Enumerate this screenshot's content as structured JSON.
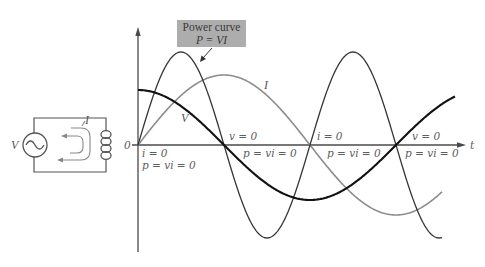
{
  "power_box": {
    "title": "Power curve",
    "equation": "P = VI",
    "fill": "#adadad"
  },
  "axes": {
    "origin_label": "0",
    "x_label": "t"
  },
  "curve_labels": {
    "current": "I",
    "voltage": "V"
  },
  "annotations": [
    {
      "text": "i = 0"
    },
    {
      "text": "p = vi = 0"
    },
    {
      "text": "v = 0"
    },
    {
      "text": "p = vi = 0"
    },
    {
      "text": "i = 0"
    },
    {
      "text": "p = vi = 0"
    },
    {
      "text": "v = 0"
    },
    {
      "text": "p = vi = 0"
    }
  ],
  "circuit": {
    "source_label": "V",
    "current_label": "I"
  },
  "plot": {
    "x0": 138,
    "y0": 145,
    "quarter_period_px": 86
  },
  "curves": [
    {
      "name": "voltage",
      "fn": "cos",
      "amplitude": 55,
      "x_end": 455,
      "color": "#111111",
      "width": 2.1
    },
    {
      "name": "current",
      "fn": "sin",
      "amplitude": 70,
      "x_end": 442,
      "color": "#8c8c8c",
      "width": 1.6
    },
    {
      "name": "power",
      "fn": "sin2",
      "amplitude": 93,
      "x_end": 442,
      "color": "#363636",
      "width": 1.3
    }
  ]
}
